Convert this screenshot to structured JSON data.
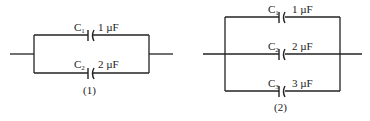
{
  "diagram": {
    "type": "capacitor-circuits",
    "circuits": [
      {
        "id": "circuit-1",
        "caption": "(1)",
        "arrangement": "parallel",
        "capacitors": [
          {
            "name": "C",
            "sub": "1",
            "value": "1 µF"
          },
          {
            "name": "C",
            "sub": "2",
            "value": "2 µF"
          }
        ]
      },
      {
        "id": "circuit-2",
        "caption": "(2)",
        "arrangement": "parallel",
        "capacitors": [
          {
            "name": "C",
            "sub": "1",
            "value": "1 µF"
          },
          {
            "name": "C",
            "sub": "2",
            "value": "2 µF"
          },
          {
            "name": "C",
            "sub": "3",
            "value": "3 µF"
          }
        ]
      }
    ]
  }
}
